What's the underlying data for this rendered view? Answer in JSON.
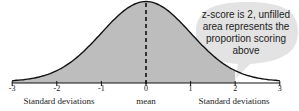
{
  "chart_data": {
    "type": "area",
    "title": "",
    "x": [
      -3,
      -2,
      -1,
      0,
      1,
      2,
      3
    ],
    "tick_labels": [
      "-3",
      "-2",
      "-1",
      "0",
      "1",
      "2",
      "3"
    ],
    "shaded_range": [
      -3,
      2
    ],
    "unshaded_range": [
      2,
      3
    ],
    "mean_marker": 0,
    "xlabel_left": "Standard deviations",
    "xlabel_center": "mean",
    "xlabel_right": "Standard deviations",
    "annotation": "z-score is 2, unfilled area represents the proportion scoring above",
    "colors": {
      "fill": "#bdbdbd",
      "bubble": "#e3e3e3",
      "curve": "#111111"
    }
  },
  "ticks": [
    "-3",
    "-2",
    "-1",
    "0",
    "1",
    "2",
    "3"
  ],
  "labels": {
    "left": "Standard deviations",
    "center": "mean",
    "right": "Standard deviations"
  },
  "callout": "z-score is 2, unfilled area represents the proportion scoring above"
}
